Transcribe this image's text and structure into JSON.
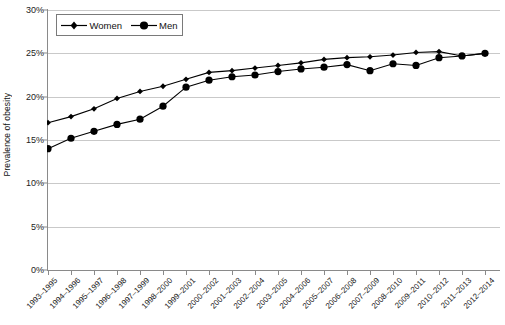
{
  "chart_data": {
    "type": "line",
    "title": "",
    "xlabel": "",
    "ylabel": "Prevalence of obesity",
    "ylim": [
      0,
      30
    ],
    "ytick_labels": [
      "0%",
      "5%",
      "10%",
      "15%",
      "20%",
      "25%",
      "30%"
    ],
    "ytick_values": [
      0,
      5,
      10,
      15,
      20,
      25,
      30
    ],
    "grid": true,
    "legend_position": "top-left",
    "categories": [
      "1993–1995",
      "1994–1996",
      "1995–1997",
      "1996–1998",
      "1997–1999",
      "1998–2000",
      "1999–2001",
      "2000–2002",
      "2001–2003",
      "2002–2004",
      "2003–2005",
      "2004–2006",
      "2005–2007",
      "2006–2008",
      "2007–2009",
      "2008–2010",
      "2009–2011",
      "2010–2012",
      "2011–2013",
      "2012–2014"
    ],
    "series": [
      {
        "name": "Women",
        "marker": "diamond",
        "color": "#000000",
        "values": [
          17.0,
          17.7,
          18.6,
          19.8,
          20.6,
          21.2,
          22.0,
          22.8,
          23.0,
          23.3,
          23.6,
          23.9,
          24.3,
          24.5,
          24.6,
          24.8,
          25.1,
          25.2,
          24.7,
          25.0
        ]
      },
      {
        "name": "Men",
        "marker": "circle",
        "color": "#000000",
        "values": [
          14.0,
          15.2,
          16.0,
          16.8,
          17.4,
          18.9,
          21.1,
          21.9,
          22.3,
          22.5,
          22.9,
          23.2,
          23.4,
          23.7,
          23.0,
          23.8,
          23.6,
          24.5,
          24.7,
          25.0
        ]
      }
    ]
  },
  "legend": {
    "items": [
      {
        "label": "Women"
      },
      {
        "label": "Men"
      }
    ]
  }
}
